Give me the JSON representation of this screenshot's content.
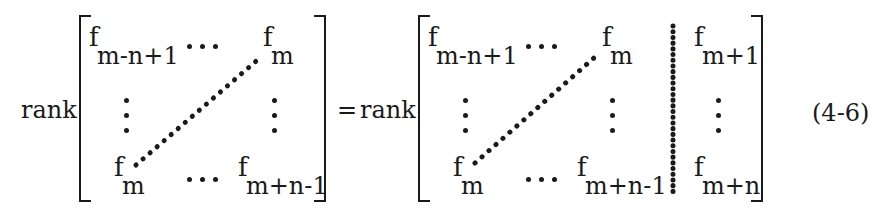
{
  "equation": {
    "lhs_operator": "rank",
    "equals": "=",
    "rhs_operator": "rank",
    "label": "(4-6)"
  },
  "lhs_matrix": {
    "top_left": {
      "base": "f",
      "sub": "m-n+1"
    },
    "top_right": {
      "base": "f",
      "sub": "m"
    },
    "bottom_left": {
      "base": "f",
      "sub": "m"
    },
    "bottom_right": {
      "base": "f",
      "sub": "m+n-1"
    }
  },
  "rhs_matrix": {
    "top_left": {
      "base": "f",
      "sub": "m-n+1"
    },
    "top_right": {
      "base": "f",
      "sub": "m"
    },
    "bottom_left": {
      "base": "f",
      "sub": "m"
    },
    "bottom_right": {
      "base": "f",
      "sub": "m+n-1"
    },
    "augmented_top": {
      "base": "f",
      "sub": "m+1"
    },
    "augmented_bottom": {
      "base": "f",
      "sub": "m+n"
    }
  }
}
